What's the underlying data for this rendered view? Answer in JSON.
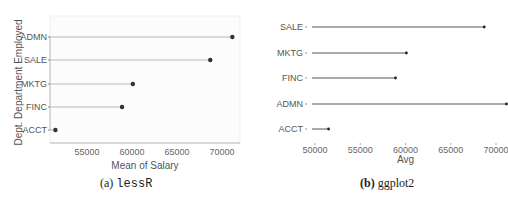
{
  "chart_data": [
    {
      "type": "lollipop",
      "panel": "a",
      "caption_label": "(a)",
      "caption_name": "lessR",
      "title": "",
      "xlabel": "Mean of Salary",
      "ylabel": "Dept. Department Employed",
      "categories": [
        "ADMN",
        "SALE",
        "MKTG",
        "FINC",
        "ACCT"
      ],
      "values": [
        71150,
        68700,
        60100,
        58900,
        51500
      ],
      "x_ticks": [
        55000,
        60000,
        65000,
        70000
      ],
      "xlim": [
        50900,
        72000
      ],
      "sorted": "descending",
      "grid": false,
      "segment_color": "#aaaaaa",
      "dot_color": "#333333"
    },
    {
      "type": "lollipop",
      "panel": "b",
      "caption_label": "(b)",
      "caption_name": "ggplot2",
      "title": "",
      "xlabel": "Avg",
      "ylabel": "",
      "categories": [
        "SALE",
        "MKTG",
        "FINC",
        "ADMN",
        "ACCT"
      ],
      "values": [
        68700,
        60100,
        58900,
        71150,
        51500
      ],
      "x_ticks": [
        50000,
        55000,
        60000,
        65000,
        70000
      ],
      "xlim": [
        49800,
        71800
      ],
      "grid": false,
      "segment_color": "#444444",
      "dot_color": "#222222"
    }
  ]
}
